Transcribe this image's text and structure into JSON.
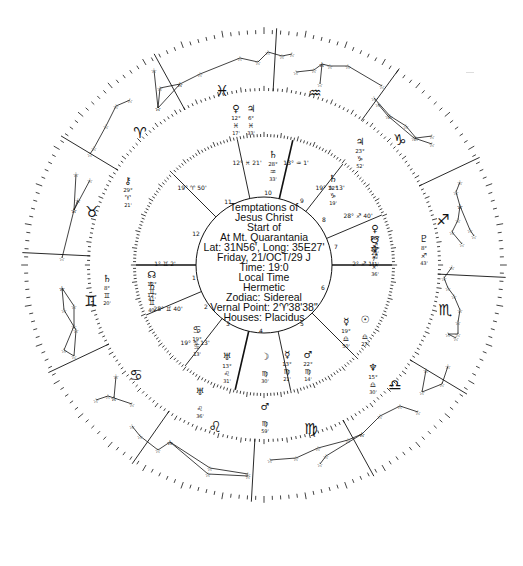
{
  "chart": {
    "title_lines": [
      "Temptations of",
      "Jesus Christ",
      "Start of",
      "At Mt. Quarantania",
      "Lat: 31N56', Long: 35E27'",
      "Friday, 21/OCT/29  J",
      "Time: 19:0",
      "Local Time",
      "Hermetic",
      "Zodiac: Sidereal",
      "Vernal Point: 2♈︎38'38\"",
      "Houses: Placidus"
    ],
    "event": "Temptations of Jesus Christ",
    "event_sub": "Start of",
    "location": "At Mt. Quarantania",
    "latitude": "31N56'",
    "longitude": "35E27'",
    "date": "Friday, 21/OCT/29 J",
    "time": "19:0",
    "time_type": "Local Time",
    "system": "Hermetic",
    "zodiac": "Sidereal",
    "vernal_point": "2♈︎38'38\"",
    "houses": "Placidus"
  },
  "geometry": {
    "cx": 264,
    "cy": 265,
    "outer_rx": 240,
    "outer_ry": 235,
    "middle_r": 174,
    "inner_r": 128,
    "center_r": 68
  },
  "zodiac_signs": [
    {
      "name": "pisces",
      "glyph": "♓︎",
      "x": 222,
      "y": 96
    },
    {
      "name": "aquarius",
      "glyph": "♒︎",
      "x": 315,
      "y": 98
    },
    {
      "name": "capricorn",
      "glyph": "♑︎",
      "x": 400,
      "y": 145
    },
    {
      "name": "sagittarius",
      "glyph": "♐︎",
      "x": 443,
      "y": 225
    },
    {
      "name": "scorpio",
      "glyph": "♏︎",
      "x": 445,
      "y": 315
    },
    {
      "name": "libra",
      "glyph": "♎︎",
      "x": 395,
      "y": 390
    },
    {
      "name": "virgo",
      "glyph": "♍︎",
      "x": 311,
      "y": 434
    },
    {
      "name": "leo",
      "glyph": "♌︎",
      "x": 215,
      "y": 432
    },
    {
      "name": "cancer",
      "glyph": "♋︎",
      "x": 136,
      "y": 380
    },
    {
      "name": "gemini",
      "glyph": "♊︎",
      "x": 91,
      "y": 306
    },
    {
      "name": "taurus",
      "glyph": "♉︎",
      "x": 92,
      "y": 217
    },
    {
      "name": "aries",
      "glyph": "♈︎",
      "x": 140,
      "y": 138
    }
  ],
  "sign_divider_angles_deg": [
    -87,
    -56,
    -27,
    3,
    33,
    63,
    93,
    123,
    153,
    183,
    213,
    243
  ],
  "house_cusps": [
    {
      "house": 1,
      "angle_deg": 180,
      "label": "1° ♊︎ 2'",
      "lx": 165,
      "ly": 266
    },
    {
      "house": 2,
      "angle_deg": 157,
      "label": "28° ♊︎ 40'",
      "lx": 168,
      "ly": 311
    },
    {
      "house": 3,
      "angle_deg": 128,
      "label": "19° ♋︎ 13'",
      "lx": 195,
      "ly": 345
    },
    {
      "house": 4,
      "angle_deg": 103,
      "label": "13° ♌︎ 31'",
      "lx": 0,
      "ly": 0
    },
    {
      "house": 5,
      "angle_deg": 78,
      "label": "13° ♍︎ 21'",
      "lx": 0,
      "ly": 0
    },
    {
      "house": 6,
      "angle_deg": 45,
      "label": "",
      "lx": 0,
      "ly": 0
    },
    {
      "house": 7,
      "angle_deg": 0,
      "label": "2° ♐︎ 1'",
      "lx": 363,
      "ly": 266
    },
    {
      "house": 8,
      "angle_deg": -23,
      "label": "28° ♐︎ 40'",
      "lx": 358,
      "ly": 218
    },
    {
      "house": 9,
      "angle_deg": -52,
      "label": "19° ♑︎ 13'",
      "lx": 330,
      "ly": 190
    },
    {
      "house": 10,
      "angle_deg": -77,
      "label": "13° ♒︎ 1'",
      "lx": 296,
      "ly": 165
    },
    {
      "house": 11,
      "angle_deg": -102,
      "label": "12° ♓︎ 21'",
      "lx": 247,
      "ly": 165
    },
    {
      "house": 12,
      "angle_deg": -135,
      "label": "19° ♈︎ 50'",
      "lx": 192,
      "ly": 190
    }
  ],
  "house_numbers": [
    {
      "n": "1",
      "x": 194,
      "y": 280
    },
    {
      "n": "2",
      "x": 206,
      "y": 309
    },
    {
      "n": "3",
      "x": 228,
      "y": 326
    },
    {
      "n": "4",
      "x": 261,
      "y": 333
    },
    {
      "n": "5",
      "x": 302,
      "y": 326
    },
    {
      "n": "6",
      "x": 323,
      "y": 290
    },
    {
      "n": "7",
      "x": 336,
      "y": 249
    },
    {
      "n": "8",
      "x": 324,
      "y": 222
    },
    {
      "n": "9",
      "x": 302,
      "y": 203
    },
    {
      "n": "10",
      "x": 268,
      "y": 195
    },
    {
      "n": "11",
      "x": 228,
      "y": 204
    },
    {
      "n": "12",
      "x": 196,
      "y": 236
    }
  ],
  "planets": [
    {
      "name": "venus",
      "glyph": "♀︎",
      "deg": "12°",
      "sign": "♓︎",
      "min": "17'",
      "x": 236,
      "y": 112
    },
    {
      "name": "jupiter",
      "glyph": "♃︎",
      "deg": "6°",
      "sign": "♓︎",
      "min": "33'",
      "x": 251,
      "y": 112
    },
    {
      "name": "neptune-aqua",
      "glyph": "♄︎",
      "deg": "28°",
      "sign": "♒︎",
      "min": "33'",
      "x": 273,
      "y": 158
    },
    {
      "name": "jupiter-cap",
      "glyph": "♃︎",
      "deg": "23°",
      "sign": "♑︎",
      "min": "52'",
      "x": 360,
      "y": 145
    },
    {
      "name": "sun-cap-node",
      "glyph": "♄︎",
      "deg": "22°",
      "sign": "♑︎",
      "min": "19'",
      "x": 333,
      "y": 182
    },
    {
      "name": "pluto",
      "glyph": "♇︎",
      "deg": "8°",
      "sign": "♐︎",
      "min": "43'",
      "x": 424,
      "y": 242
    },
    {
      "name": "venus-sag",
      "glyph": "♀︎",
      "deg": "16°",
      "sign": "♐︎",
      "min": "29'",
      "x": 375,
      "y": 232
    },
    {
      "name": "south-node",
      "glyph": "☋︎",
      "deg": "12°",
      "sign": "♐︎",
      "min": "41'",
      "x": 375,
      "y": 243
    },
    {
      "name": "neptune",
      "glyph": "♆︎",
      "deg": "7°",
      "sign": "♐︎",
      "min": "36'",
      "x": 375,
      "y": 253
    },
    {
      "name": "chiron",
      "glyph": "⚷︎",
      "deg": "29°",
      "sign": "♈︎",
      "min": "21'",
      "x": 128,
      "y": 184
    },
    {
      "name": "saturn",
      "glyph": "♄︎",
      "deg": "8°",
      "sign": "♊︎",
      "min": "20'",
      "x": 107,
      "y": 282
    },
    {
      "name": "north-node",
      "glyph": "☊︎",
      "deg": "12°",
      "sign": "♊︎",
      "min": "41'",
      "x": 152,
      "y": 278
    },
    {
      "name": "saturn-2",
      "glyph": "♄︎",
      "deg": "12°",
      "sign": "♊︎",
      "min": "40'",
      "x": 152,
      "y": 289
    },
    {
      "name": "moon",
      "glyph": "☽︎",
      "deg": "",
      "sign": "♍︎",
      "min": "30'",
      "x": 265,
      "y": 360
    },
    {
      "name": "mercury-virgo",
      "glyph": "☿︎",
      "deg": "13°",
      "sign": "♍︎",
      "min": "21'",
      "x": 287,
      "y": 358
    },
    {
      "name": "mars",
      "glyph": "♂︎",
      "deg": "22°",
      "sign": "♍︎",
      "min": "14'",
      "x": 308,
      "y": 358
    },
    {
      "name": "mars-outer",
      "glyph": "♂︎",
      "deg": "",
      "sign": "♍︎",
      "min": "59'",
      "x": 265,
      "y": 410
    },
    {
      "name": "uranus",
      "glyph": "♅︎",
      "deg": "13°",
      "sign": "♌︎",
      "min": "31'",
      "x": 227,
      "y": 360
    },
    {
      "name": "uranus-outer",
      "glyph": "♅︎",
      "deg": "",
      "sign": "♌︎",
      "min": "36'",
      "x": 200,
      "y": 395
    },
    {
      "name": "sun",
      "glyph": "☉︎",
      "deg": "",
      "sign": "♎︎",
      "min": "27'",
      "x": 365,
      "y": 323
    },
    {
      "name": "mercury",
      "glyph": "☿︎",
      "deg": "19°",
      "sign": "♎︎",
      "min": "50'",
      "x": 346,
      "y": 325
    },
    {
      "name": "neptune-libra",
      "glyph": "♆︎",
      "deg": "15°",
      "sign": "♎︎",
      "min": "30'",
      "x": 373,
      "y": 371
    },
    {
      "name": "cancer-point",
      "glyph": "♋︎",
      "deg": "19°",
      "sign": "♋︎",
      "min": "13'",
      "x": 197,
      "y": 333
    }
  ],
  "constellations": [
    {
      "name": "pisces-stars",
      "points": [
        [
          158,
          108
        ],
        [
          160,
          88
        ],
        [
          180,
          84
        ],
        [
          200,
          74
        ],
        [
          240,
          58
        ],
        [
          258,
          62
        ],
        [
          268,
          52
        ],
        [
          282,
          56
        ],
        [
          292,
          54
        ]
      ]
    },
    {
      "name": "pisces-stars-2",
      "points": [
        [
          154,
          70
        ],
        [
          158,
          108
        ],
        [
          180,
          84
        ]
      ]
    },
    {
      "name": "aquarius-stars",
      "points": [
        [
          296,
          72
        ],
        [
          314,
          70
        ],
        [
          322,
          64
        ],
        [
          330,
          66
        ],
        [
          348,
          66
        ],
        [
          382,
          86
        ]
      ]
    },
    {
      "name": "aquarius-stars-2",
      "points": [
        [
          322,
          64
        ],
        [
          320,
          84
        ]
      ]
    },
    {
      "name": "capricorn-stars",
      "points": [
        [
          374,
          98
        ],
        [
          390,
          116
        ],
        [
          406,
          126
        ],
        [
          416,
          138
        ],
        [
          432,
          136
        ]
      ]
    },
    {
      "name": "capricorn-stars-2",
      "points": [
        [
          378,
          104
        ],
        [
          388,
          116
        ],
        [
          414,
          138
        ],
        [
          432,
          144
        ]
      ]
    },
    {
      "name": "sagittarius-stars",
      "points": [
        [
          460,
          182
        ],
        [
          456,
          192
        ],
        [
          460,
          206
        ],
        [
          458,
          220
        ],
        [
          452,
          232
        ],
        [
          462,
          244
        ]
      ]
    },
    {
      "name": "sagittarius-stars-2",
      "points": [
        [
          460,
          206
        ],
        [
          470,
          230
        ],
        [
          474,
          236
        ]
      ]
    },
    {
      "name": "scorpio-stars",
      "points": [
        [
          452,
          267
        ],
        [
          444,
          278
        ],
        [
          448,
          288
        ],
        [
          454,
          296
        ],
        [
          460,
          310
        ],
        [
          458,
          322
        ],
        [
          458,
          334
        ],
        [
          448,
          334
        ],
        [
          456,
          338
        ]
      ]
    },
    {
      "name": "libra-stars",
      "points": [
        [
          426,
          370
        ],
        [
          422,
          392
        ],
        [
          442,
          384
        ],
        [
          448,
          366
        ]
      ]
    },
    {
      "name": "virgo-stars",
      "points": [
        [
          270,
          460
        ],
        [
          296,
          458
        ],
        [
          318,
          448
        ],
        [
          348,
          440
        ],
        [
          362,
          434
        ],
        [
          380,
          416
        ],
        [
          400,
          406
        ],
        [
          418,
          412
        ]
      ]
    },
    {
      "name": "virgo-stars-2",
      "points": [
        [
          320,
          464
        ],
        [
          326,
          456
        ],
        [
          362,
          434
        ]
      ]
    },
    {
      "name": "leo-stars",
      "points": [
        [
          132,
          426
        ],
        [
          140,
          436
        ],
        [
          158,
          450
        ],
        [
          170,
          442
        ],
        [
          210,
          468
        ],
        [
          248,
          474
        ]
      ]
    },
    {
      "name": "leo-stars-2",
      "points": [
        [
          170,
          442
        ],
        [
          208,
          474
        ],
        [
          248,
          476
        ]
      ]
    },
    {
      "name": "cancer-stars",
      "points": [
        [
          96,
          400
        ],
        [
          108,
          396
        ],
        [
          114,
          398
        ],
        [
          132,
          404
        ]
      ]
    },
    {
      "name": "cancer-stars-2",
      "points": [
        [
          114,
          398
        ],
        [
          116,
          376
        ]
      ]
    },
    {
      "name": "gemini-stars",
      "points": [
        [
          62,
          288
        ],
        [
          74,
          306
        ],
        [
          74,
          326
        ],
        [
          64,
          350
        ],
        [
          74,
          356
        ],
        [
          76,
          330
        ],
        [
          64,
          310
        ],
        [
          62,
          288
        ]
      ]
    },
    {
      "name": "taurus-stars",
      "points": [
        [
          76,
          174
        ],
        [
          74,
          210
        ],
        [
          62,
          258
        ]
      ]
    },
    {
      "name": "taurus-stars-2",
      "points": [
        [
          90,
          180
        ],
        [
          74,
          210
        ],
        [
          78,
          200
        ]
      ]
    },
    {
      "name": "aries-stars",
      "points": [
        [
          90,
          154
        ],
        [
          94,
          148
        ],
        [
          106,
          126
        ],
        [
          116,
          106
        ],
        [
          130,
          100
        ]
      ]
    }
  ],
  "colors": {
    "ink": "#111111",
    "background": "#ffffff"
  }
}
